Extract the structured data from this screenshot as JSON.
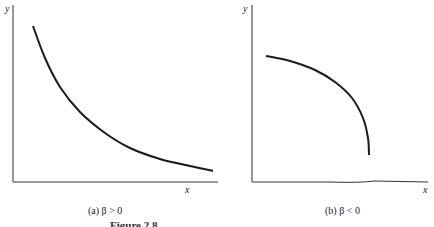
{
  "figure": {
    "caption": "Figure 2.8"
  },
  "chart_data": [
    {
      "type": "line",
      "title": "(a) β > 0",
      "xlabel": "x",
      "ylabel": "y",
      "grid": false,
      "ticks": false,
      "description": "Decreasing convex curve, steep at left, flattening toward the right",
      "points": [
        [
          33,
          26
        ],
        [
          45,
          58
        ],
        [
          60,
          87
        ],
        [
          80,
          112
        ],
        [
          105,
          133
        ],
        [
          130,
          148
        ],
        [
          160,
          159
        ],
        [
          190,
          166
        ],
        [
          213,
          171
        ]
      ]
    },
    {
      "type": "line",
      "title": "(b) β < 0",
      "xlabel": "x",
      "ylabel": "y",
      "grid": false,
      "ticks": false,
      "description": "Decreasing concave curve, nearly flat at left, dropping steeply at right end",
      "points": [
        [
          266,
          56
        ],
        [
          290,
          61
        ],
        [
          315,
          70
        ],
        [
          335,
          82
        ],
        [
          352,
          98
        ],
        [
          363,
          118
        ],
        [
          368,
          138
        ],
        [
          369,
          155
        ]
      ]
    }
  ]
}
